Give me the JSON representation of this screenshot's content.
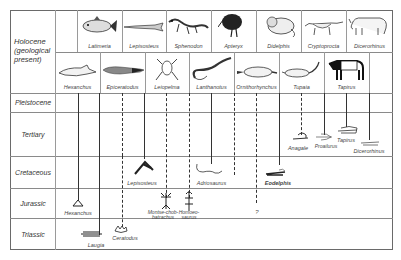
{
  "eras": {
    "holocene": "Holocene (geological present)",
    "pleistocene": "Pleistocene",
    "tertiary": "Tertiary",
    "cretaceous": "Cretaceous",
    "jurassic": "Jurassic",
    "triassic": "Triassic"
  },
  "holocene_row1": [
    "Latimeria",
    "Lepisosteus",
    "Sphenodon",
    "Apteryx",
    "Didelphis",
    "Cryptoprocta",
    "Dicerorhinus"
  ],
  "holocene_row2": [
    "Hexanchus",
    "Epiceratodus",
    "Leiopelma",
    "Lanthanotus",
    "Ornithorhynchus",
    "Tupaia",
    "Tapirus"
  ],
  "fossils": {
    "tertiary": [
      "Anagale",
      "Proailurus",
      "Tapirus",
      "Dicerorhinus"
    ],
    "cretaceous": [
      "Lepisosteus",
      "Adriosaurus",
      "Eodelphis"
    ],
    "jurassic": [
      "Hexanchus",
      "Montsechobatrachus",
      "Homoeosaurus"
    ],
    "jurassic_split": {
      "monte_a": "Montse-chob-",
      "monte_b": "batrachus",
      "homo_a": "Homoeo-",
      "homo_b": "saurus"
    },
    "triassic": [
      "Laugia",
      "Ceratodus"
    ],
    "uncertain_mark": "?"
  }
}
